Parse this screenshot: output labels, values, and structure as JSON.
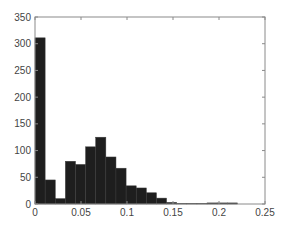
{
  "chart_data": {
    "type": "bar",
    "subtype": "histogram",
    "title": "",
    "xlabel": "",
    "ylabel": "",
    "bin_width": 0.011,
    "bin_start": 0,
    "categories": [
      "0.0055",
      "0.0165",
      "0.0275",
      "0.0385",
      "0.0495",
      "0.0605",
      "0.0715",
      "0.0825",
      "0.0935",
      "0.1045",
      "0.1155",
      "0.1265",
      "0.1375",
      "0.1485",
      "0.1595",
      "0.1705",
      "0.1815",
      "0.1925",
      "0.2035",
      "0.2145"
    ],
    "values": [
      311,
      45,
      10,
      80,
      74,
      107,
      125,
      88,
      67,
      34,
      30,
      21,
      11,
      3,
      1,
      1,
      1,
      2,
      2,
      2
    ],
    "xlim": [
      0,
      0.25
    ],
    "ylim": [
      0,
      350
    ],
    "xticks": [
      "0",
      "0.05",
      "0.1",
      "0.15",
      "0.2",
      "0.25"
    ],
    "xtick_values": [
      0,
      0.05,
      0.1,
      0.15,
      0.2,
      0.25
    ],
    "yticks": [
      "0",
      "50",
      "100",
      "150",
      "200",
      "250",
      "300",
      "350"
    ],
    "ytick_values": [
      0,
      50,
      100,
      150,
      200,
      250,
      300,
      350
    ],
    "grid": false,
    "legend": null,
    "colors": {
      "bar": "#1e1e1e",
      "bar_edge": "#3a3a3a",
      "axis": "#8a8a8a",
      "text": "#444444"
    }
  }
}
